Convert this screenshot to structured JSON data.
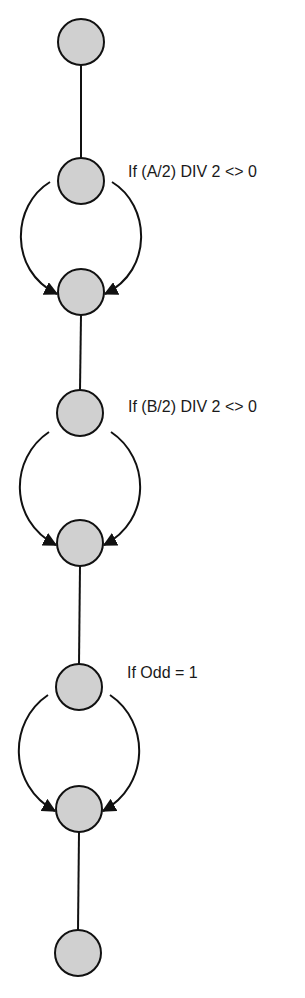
{
  "diagram": {
    "type": "control-flow-graph",
    "node_style": {
      "fill": "#d0d0d0",
      "stroke": "#111111",
      "radius": 23
    },
    "nodes": [
      {
        "id": "n1",
        "x": 81,
        "y": 42
      },
      {
        "id": "n2",
        "x": 81,
        "y": 181
      },
      {
        "id": "n3",
        "x": 81,
        "y": 292
      },
      {
        "id": "n4",
        "x": 80,
        "y": 413
      },
      {
        "id": "n5",
        "x": 80,
        "y": 543
      },
      {
        "id": "n6",
        "x": 79,
        "y": 687
      },
      {
        "id": "n7",
        "x": 79,
        "y": 809
      },
      {
        "id": "n8",
        "x": 78,
        "y": 953
      }
    ],
    "edges": [
      {
        "from": "n1",
        "to": "n2",
        "kind": "straight"
      },
      {
        "from": "n2",
        "to": "n3",
        "kind": "branch-left"
      },
      {
        "from": "n2",
        "to": "n3",
        "kind": "branch-right"
      },
      {
        "from": "n3",
        "to": "n4",
        "kind": "straight"
      },
      {
        "from": "n4",
        "to": "n5",
        "kind": "branch-left"
      },
      {
        "from": "n4",
        "to": "n5",
        "kind": "branch-right"
      },
      {
        "from": "n5",
        "to": "n6",
        "kind": "straight"
      },
      {
        "from": "n6",
        "to": "n7",
        "kind": "branch-left"
      },
      {
        "from": "n6",
        "to": "n7",
        "kind": "branch-right"
      },
      {
        "from": "n7",
        "to": "n8",
        "kind": "straight"
      }
    ],
    "labels": [
      {
        "node": "n2",
        "text": "If (A/2) DIV 2 <> 0"
      },
      {
        "node": "n4",
        "text": "If (B/2) DIV 2 <> 0"
      },
      {
        "node": "n6",
        "text": "If Odd = 1"
      }
    ]
  }
}
